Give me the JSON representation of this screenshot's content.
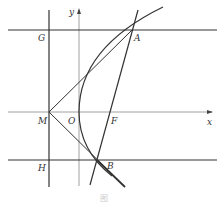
{
  "diagram": {
    "type": "geometry",
    "colors": {
      "stroke": "#333333",
      "axis": "#777777",
      "background": "#ffffff"
    },
    "axes": {
      "x_label": "x",
      "y_label": "y",
      "origin_label": "O"
    },
    "points": {
      "G": {
        "label": "G",
        "x": 49,
        "y": 30
      },
      "A": {
        "label": "A",
        "x": 132,
        "y": 30
      },
      "M": {
        "label": "M",
        "x": 49,
        "y": 112
      },
      "O": {
        "label": "O",
        "x": 79,
        "y": 112
      },
      "F": {
        "label": "F",
        "x": 109,
        "y": 112
      },
      "H": {
        "label": "H",
        "x": 49,
        "y": 160
      },
      "B": {
        "label": "B",
        "x": 97,
        "y": 160
      }
    },
    "caption": "图"
  }
}
